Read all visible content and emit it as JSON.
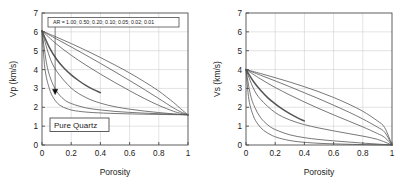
{
  "figure": {
    "background_color": "#ffffff",
    "axis_color": "#4d4d4d",
    "grid_color": "#d0d0d0",
    "curve_color": "#555555"
  },
  "chart_data": [
    {
      "type": "line",
      "panel": "left",
      "title": "",
      "xlabel": "Porosity",
      "ylabel": "Vp (km/s)",
      "xlim": [
        0,
        1
      ],
      "ylim": [
        0,
        7
      ],
      "xticks": [
        "0",
        "0.2",
        "0.4",
        "0.6",
        "0.8",
        "1"
      ],
      "xtick_values": [
        0,
        0.2,
        0.4,
        0.6,
        0.8,
        1
      ],
      "yticks": [
        "0",
        "1",
        "2",
        "3",
        "4",
        "5",
        "6",
        "7"
      ],
      "ytick_values": [
        0,
        1,
        2,
        3,
        4,
        5,
        6,
        7
      ],
      "grid": true,
      "legend_position": "none",
      "annotations": [
        {
          "name": "aspect-ratio-box",
          "text": "AR = 1.00; 0.50; 0.20; 0.10; 0.05; 0.02; 0.01",
          "x": 0.06,
          "y": 6.55,
          "boxed": true
        },
        {
          "name": "material-box",
          "text": "Pure Quartz",
          "x": 0.06,
          "y": 1.05,
          "boxed": true
        }
      ],
      "leader_line": {
        "x": 0.09,
        "y_from": 6.3,
        "y_to": 2.82
      },
      "marker": {
        "x": 0.09,
        "y": 2.82,
        "shape": "triangle-down"
      },
      "mineral_endpoint": {
        "porosity": 0,
        "velocity": 6.05
      },
      "fluid_endpoint": {
        "porosity": 1,
        "velocity": 1.6
      },
      "series": [
        {
          "name": "AR = 1.00",
          "aspect_ratio": 1.0,
          "x": [
            0,
            0.1,
            0.2,
            0.3,
            0.4,
            0.5,
            0.6,
            0.7,
            0.8,
            0.9,
            0.95,
            1
          ],
          "values": [
            6.05,
            5.72,
            5.38,
            5.02,
            4.64,
            4.24,
            3.82,
            3.36,
            2.86,
            2.26,
            1.92,
            1.6
          ]
        },
        {
          "name": "AR = 0.50",
          "aspect_ratio": 0.5,
          "x": [
            0,
            0.1,
            0.2,
            0.3,
            0.4,
            0.5,
            0.6,
            0.7,
            0.8,
            0.9,
            0.95,
            1
          ],
          "values": [
            6.05,
            5.62,
            5.2,
            4.77,
            4.33,
            3.88,
            3.42,
            2.95,
            2.46,
            1.97,
            1.76,
            1.6
          ]
        },
        {
          "name": "AR = 0.20",
          "aspect_ratio": 0.2,
          "x": [
            0,
            0.1,
            0.2,
            0.3,
            0.4,
            0.5,
            0.6,
            0.7,
            0.8,
            0.9,
            0.95,
            1
          ],
          "values": [
            6.05,
            5.35,
            4.76,
            4.24,
            3.76,
            3.31,
            2.88,
            2.47,
            2.1,
            1.79,
            1.68,
            1.6
          ]
        },
        {
          "name": "AR = 0.10",
          "aspect_ratio": 0.1,
          "x": [
            0,
            0.05,
            0.1,
            0.15,
            0.2,
            0.25,
            0.3,
            0.35,
            0.4
          ],
          "values": [
            6.05,
            5.18,
            4.55,
            4.08,
            3.72,
            3.42,
            3.16,
            2.95,
            2.78
          ],
          "truncated": true,
          "style": "thick"
        },
        {
          "name": "AR = 0.05",
          "aspect_ratio": 0.05,
          "x": [
            0,
            0.05,
            0.1,
            0.2,
            0.3,
            0.4,
            0.5,
            0.6,
            0.7,
            0.8,
            0.9,
            1
          ],
          "values": [
            6.05,
            4.72,
            3.92,
            3.02,
            2.52,
            2.22,
            2.03,
            1.9,
            1.8,
            1.72,
            1.65,
            1.6
          ]
        },
        {
          "name": "AR = 0.02",
          "aspect_ratio": 0.02,
          "x": [
            0,
            0.03,
            0.06,
            0.1,
            0.15,
            0.2,
            0.3,
            0.4,
            0.5,
            0.6,
            0.7,
            0.8,
            0.9,
            1
          ],
          "values": [
            6.05,
            4.38,
            3.5,
            2.85,
            2.42,
            2.2,
            1.97,
            1.86,
            1.78,
            1.73,
            1.69,
            1.66,
            1.63,
            1.6
          ]
        },
        {
          "name": "AR = 0.01",
          "aspect_ratio": 0.01,
          "x": [
            0,
            0.02,
            0.05,
            0.08,
            0.12,
            0.18,
            0.25,
            0.35,
            0.5,
            0.65,
            0.8,
            0.9,
            1
          ],
          "values": [
            6.05,
            4.05,
            3.0,
            2.48,
            2.12,
            1.9,
            1.79,
            1.72,
            1.67,
            1.64,
            1.62,
            1.61,
            1.6
          ]
        }
      ]
    },
    {
      "type": "line",
      "panel": "right",
      "title": "",
      "xlabel": "Porosity",
      "ylabel": "Vs (km/s)",
      "xlim": [
        0,
        1
      ],
      "ylim": [
        0,
        7
      ],
      "xticks": [
        "0",
        "0.2",
        "0.4",
        "0.6",
        "0.8",
        "1"
      ],
      "xtick_values": [
        0,
        0.2,
        0.4,
        0.6,
        0.8,
        1
      ],
      "yticks": [
        "0",
        "1",
        "2",
        "3",
        "4",
        "5",
        "6",
        "7"
      ],
      "ytick_values": [
        0,
        1,
        2,
        3,
        4,
        5,
        6,
        7
      ],
      "grid": true,
      "legend_position": "none",
      "annotations": [],
      "mineral_endpoint": {
        "porosity": 0,
        "velocity": 4.0
      },
      "fluid_endpoint": {
        "porosity": 1,
        "velocity": 0.0
      },
      "series": [
        {
          "name": "AR = 1.00",
          "aspect_ratio": 1.0,
          "x": [
            0,
            0.1,
            0.2,
            0.3,
            0.4,
            0.5,
            0.6,
            0.7,
            0.8,
            0.9,
            0.95,
            1
          ],
          "values": [
            4.0,
            3.79,
            3.57,
            3.34,
            3.09,
            2.82,
            2.52,
            2.18,
            1.79,
            1.28,
            0.92,
            0.0
          ]
        },
        {
          "name": "AR = 0.50",
          "aspect_ratio": 0.5,
          "x": [
            0,
            0.1,
            0.2,
            0.3,
            0.4,
            0.5,
            0.6,
            0.7,
            0.8,
            0.9,
            0.95,
            1
          ],
          "values": [
            4.0,
            3.7,
            3.4,
            3.09,
            2.77,
            2.45,
            2.11,
            1.76,
            1.38,
            0.95,
            0.68,
            0.0
          ]
        },
        {
          "name": "AR = 0.20",
          "aspect_ratio": 0.2,
          "x": [
            0,
            0.1,
            0.2,
            0.3,
            0.4,
            0.5,
            0.6,
            0.7,
            0.8,
            0.9,
            0.95,
            1
          ],
          "values": [
            4.0,
            3.5,
            3.05,
            2.65,
            2.28,
            1.93,
            1.6,
            1.28,
            0.96,
            0.61,
            0.4,
            0.0
          ]
        },
        {
          "name": "AR = 0.10",
          "aspect_ratio": 0.1,
          "x": [
            0,
            0.05,
            0.1,
            0.15,
            0.2,
            0.25,
            0.3,
            0.35,
            0.4
          ],
          "values": [
            4.0,
            3.38,
            2.9,
            2.5,
            2.18,
            1.9,
            1.66,
            1.45,
            1.27
          ],
          "truncated": true,
          "style": "thick"
        },
        {
          "name": "AR = 0.05",
          "aspect_ratio": 0.05,
          "x": [
            0,
            0.05,
            0.1,
            0.2,
            0.3,
            0.4,
            0.5,
            0.6,
            0.7,
            0.8,
            0.9,
            1
          ],
          "values": [
            4.0,
            3.02,
            2.42,
            1.72,
            1.33,
            1.08,
            0.9,
            0.75,
            0.61,
            0.47,
            0.3,
            0.0
          ]
        },
        {
          "name": "AR = 0.02",
          "aspect_ratio": 0.02,
          "x": [
            0,
            0.03,
            0.06,
            0.1,
            0.15,
            0.2,
            0.3,
            0.4,
            0.5,
            0.6,
            0.7,
            0.8,
            0.9,
            1
          ],
          "values": [
            4.0,
            2.68,
            2.0,
            1.45,
            1.06,
            0.82,
            0.54,
            0.39,
            0.29,
            0.22,
            0.16,
            0.1,
            0.05,
            0.0
          ]
        },
        {
          "name": "AR = 0.01",
          "aspect_ratio": 0.01,
          "x": [
            0,
            0.02,
            0.05,
            0.08,
            0.12,
            0.18,
            0.25,
            0.35,
            0.5,
            0.65,
            0.8,
            0.9,
            1
          ],
          "values": [
            4.0,
            2.4,
            1.55,
            1.12,
            0.78,
            0.5,
            0.32,
            0.18,
            0.09,
            0.05,
            0.02,
            0.01,
            0.0
          ]
        }
      ]
    }
  ]
}
